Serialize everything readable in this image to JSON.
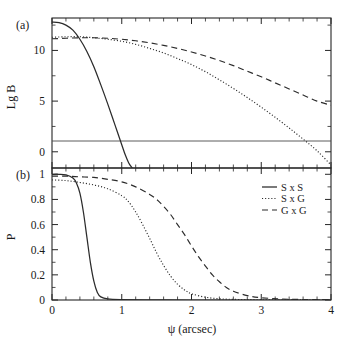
{
  "figure": {
    "panel_a_label": "(a)",
    "panel_b_label": "(b)",
    "xlabel": "ψ (arcsec)"
  },
  "chart_data": [
    {
      "type": "line",
      "panel": "(a)",
      "title": "",
      "xlabel": "ψ (arcsec)",
      "ylabel": "Lg B",
      "xlim": [
        0,
        4
      ],
      "ylim": [
        -1.6,
        13.2
      ],
      "xticks": [
        0,
        1,
        2,
        3,
        4
      ],
      "xticklabels": [
        "0",
        "1",
        "2",
        "3",
        "4"
      ],
      "yticks": [
        0,
        5,
        10
      ],
      "yticklabels": [
        "0",
        "5",
        "10"
      ],
      "grid": false,
      "annotations": [
        "horizontal reference line at Lg B = 0"
      ],
      "series": [
        {
          "name": "S x S",
          "style": "solid",
          "x": [
            0.0,
            0.1,
            0.2,
            0.3,
            0.4,
            0.5,
            0.6,
            0.7,
            0.8,
            0.9,
            1.0,
            1.05,
            1.1,
            1.15
          ],
          "y": [
            12.8,
            12.75,
            12.5,
            12.0,
            11.1,
            9.9,
            8.4,
            6.6,
            4.7,
            2.7,
            0.7,
            -0.3,
            -1.1,
            -1.6
          ]
        },
        {
          "name": "S x G",
          "style": "dotted",
          "x": [
            0.0,
            0.2,
            0.4,
            0.6,
            0.8,
            1.0,
            1.2,
            1.4,
            1.6,
            1.8,
            2.0,
            2.2,
            2.4,
            2.6,
            2.8,
            3.0,
            3.2,
            3.4,
            3.6,
            3.8,
            4.0
          ],
          "y": [
            11.3,
            11.35,
            11.35,
            11.25,
            11.1,
            10.9,
            10.6,
            10.2,
            9.75,
            9.2,
            8.6,
            7.9,
            7.1,
            6.25,
            5.35,
            4.4,
            3.4,
            2.35,
            1.25,
            0.1,
            -1.3
          ]
        },
        {
          "name": "G x G",
          "style": "dashed",
          "x": [
            0.0,
            0.2,
            0.4,
            0.6,
            0.8,
            1.0,
            1.2,
            1.4,
            1.6,
            1.8,
            2.0,
            2.2,
            2.4,
            2.6,
            2.8,
            3.0,
            3.2,
            3.4,
            3.6,
            3.8,
            4.0
          ],
          "y": [
            11.15,
            11.2,
            11.25,
            11.25,
            11.2,
            11.1,
            10.95,
            10.75,
            10.5,
            10.2,
            9.85,
            9.45,
            9.0,
            8.5,
            7.95,
            7.4,
            6.8,
            6.2,
            5.6,
            5.0,
            4.6
          ]
        }
      ]
    },
    {
      "type": "line",
      "panel": "(b)",
      "title": "",
      "xlabel": "ψ (arcsec)",
      "ylabel": "P",
      "xlim": [
        0,
        4
      ],
      "ylim": [
        0,
        1.05
      ],
      "xticks": [
        0,
        1,
        2,
        3,
        4
      ],
      "xticklabels": [
        "0",
        "1",
        "2",
        "3",
        "4"
      ],
      "yticks": [
        0,
        0.2,
        0.4,
        0.6,
        0.8,
        1
      ],
      "yticklabels": [
        "0",
        "0.2",
        "0.4",
        "0.6",
        "0.8",
        "1"
      ],
      "grid": false,
      "series": [
        {
          "name": "S x S",
          "style": "solid",
          "x": [
            0.0,
            0.1,
            0.2,
            0.3,
            0.35,
            0.4,
            0.45,
            0.5,
            0.55,
            0.6,
            0.65,
            0.7,
            0.8,
            1.0,
            1.5,
            2.0,
            3.0,
            4.0
          ],
          "y": [
            1.0,
            1.0,
            0.995,
            0.97,
            0.93,
            0.85,
            0.7,
            0.5,
            0.3,
            0.15,
            0.06,
            0.025,
            0.008,
            0.003,
            0.001,
            0.0,
            0.0,
            0.0
          ]
        },
        {
          "name": "S x G",
          "style": "dotted",
          "x": [
            0.0,
            0.2,
            0.4,
            0.6,
            0.8,
            1.0,
            1.1,
            1.2,
            1.3,
            1.4,
            1.5,
            1.6,
            1.7,
            1.8,
            1.9,
            2.0,
            2.2,
            2.4,
            2.6,
            3.0,
            3.5,
            4.0
          ],
          "y": [
            0.955,
            0.95,
            0.935,
            0.915,
            0.885,
            0.83,
            0.78,
            0.7,
            0.6,
            0.49,
            0.375,
            0.275,
            0.19,
            0.125,
            0.08,
            0.05,
            0.022,
            0.01,
            0.005,
            0.002,
            0.001,
            0.0
          ]
        },
        {
          "name": "G x G",
          "style": "dashed",
          "x": [
            0.0,
            0.2,
            0.4,
            0.6,
            0.8,
            1.0,
            1.2,
            1.4,
            1.5,
            1.6,
            1.7,
            1.8,
            1.9,
            2.0,
            2.1,
            2.2,
            2.3,
            2.4,
            2.5,
            2.6,
            2.8,
            3.0,
            3.4,
            4.0
          ],
          "y": [
            0.985,
            0.985,
            0.98,
            0.975,
            0.96,
            0.94,
            0.9,
            0.84,
            0.8,
            0.745,
            0.68,
            0.6,
            0.52,
            0.43,
            0.345,
            0.27,
            0.2,
            0.145,
            0.1,
            0.07,
            0.035,
            0.018,
            0.006,
            0.002
          ]
        }
      ]
    }
  ],
  "legend": {
    "position": "upper right of panel (b)",
    "entries": [
      {
        "label": "S x S",
        "style": "solid"
      },
      {
        "label": "S x G",
        "style": "dotted"
      },
      {
        "label": "G x G",
        "style": "dashed"
      }
    ]
  }
}
